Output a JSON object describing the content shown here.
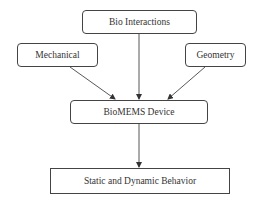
{
  "diagram": {
    "type": "flowchart",
    "nodes": [
      {
        "id": "bio",
        "label": "Bio Interactions",
        "shape": "rounded"
      },
      {
        "id": "mech",
        "label": "Mechanical",
        "shape": "rounded"
      },
      {
        "id": "geo",
        "label": "Geometry",
        "shape": "rounded"
      },
      {
        "id": "dev",
        "label": "BioMEMS Device",
        "shape": "rounded"
      },
      {
        "id": "beh",
        "label": "Static and Dynamic Behavior",
        "shape": "rectangle"
      }
    ],
    "edges": [
      {
        "from": "bio",
        "to": "dev"
      },
      {
        "from": "mech",
        "to": "dev"
      },
      {
        "from": "geo",
        "to": "dev"
      },
      {
        "from": "dev",
        "to": "beh"
      }
    ],
    "colors": {
      "stroke": "#444444",
      "text": "#333333",
      "background": "#ffffff"
    }
  }
}
